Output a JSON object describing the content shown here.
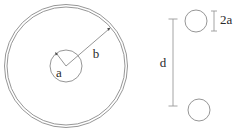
{
  "figure": {
    "background_color": "#ffffff",
    "line_color": "#8a8a8a",
    "dim_line_color": "#9a9a9a",
    "text_color": "#2a2a2a",
    "arrow_color": "#4a4a4a",
    "width": 243,
    "height": 131
  },
  "coaxial": {
    "name": "coaxial-cross-section",
    "center": {
      "x": 66,
      "y": 66
    },
    "outer_conductor": {
      "label": "b",
      "outer_radius": 61.5,
      "inner_radius": 59.0
    },
    "inner_conductor": {
      "label": "a",
      "radius": 16.0
    },
    "radius_a": {
      "label": "a",
      "label_x": 59,
      "label_y": 73,
      "tip_x": 56,
      "tip_y": 54
    },
    "radius_b": {
      "label": "b",
      "label_x": 96,
      "label_y": 55,
      "tip_x": 109,
      "tip_y": 28
    }
  },
  "two_wire": {
    "name": "two-wire-cross-section",
    "top_wire": {
      "cx": 196,
      "cy": 21,
      "r": 11.0
    },
    "bottom_wire": {
      "cx": 199,
      "cy": 110,
      "r": 11.0
    },
    "separation": {
      "label": "d",
      "label_x": 163,
      "label_y": 63,
      "line_x": 173,
      "top_y": 19,
      "bottom_y": 106,
      "cap_half_width": 4.5
    },
    "diameter": {
      "label": "2a",
      "label_x": 222,
      "label_y": 21,
      "line_x": 214,
      "top_y": 11,
      "bottom_y": 31,
      "cap_half_width": 3.0
    }
  }
}
